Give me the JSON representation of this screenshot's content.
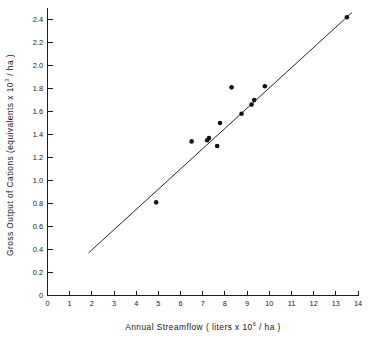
{
  "chart_data": {
    "type": "scatter",
    "title": "",
    "xlabel": "Annual Streamflow ( liters x 10⁶ / ha )",
    "xlabel_parts": {
      "prefix": "Annual  Streamflow  ( liters  x  10",
      "exponent": "6",
      "suffix": " / ha )"
    },
    "ylabel": "Gross Output of Cations (equivalents  x 10³ / ha )",
    "ylabel_parts": {
      "prefix": "Gross  Output  of  Cations  (equivalents   x 10",
      "exponent": "3",
      "suffix": " / ha )"
    },
    "xlim": [
      0,
      14
    ],
    "ylim": [
      0,
      2.5
    ],
    "xticks": [
      0,
      1,
      2,
      3,
      4,
      5,
      6,
      7,
      8,
      9,
      10,
      11,
      12,
      13,
      14
    ],
    "xticklabels": [
      "0",
      "1",
      "2",
      "3",
      "4",
      "5",
      "6",
      "7",
      "8",
      "9",
      "10",
      "11",
      "12",
      "13",
      "14"
    ],
    "yticks": [
      0,
      0.2,
      0.4,
      0.6,
      0.8,
      1.0,
      1.2,
      1.4,
      1.6,
      1.8,
      2.0,
      2.2,
      2.4
    ],
    "yticklabels": [
      "0",
      "0.2",
      "0.4",
      "0.6",
      "0.8",
      "1.0",
      "1.2",
      "1.4",
      "1.6",
      "1.8",
      "2.0",
      "2.2",
      "2.4"
    ],
    "grid": false,
    "legend": null,
    "marker": {
      "shape": "circle",
      "color": "#111111",
      "size_px": 4.6
    },
    "points": [
      {
        "x": 4.9,
        "y": 0.81
      },
      {
        "x": 6.5,
        "y": 1.34
      },
      {
        "x": 7.2,
        "y": 1.35
      },
      {
        "x": 7.28,
        "y": 1.37
      },
      {
        "x": 7.65,
        "y": 1.3
      },
      {
        "x": 7.78,
        "y": 1.5
      },
      {
        "x": 8.3,
        "y": 1.81
      },
      {
        "x": 8.75,
        "y": 1.58
      },
      {
        "x": 9.2,
        "y": 1.66
      },
      {
        "x": 9.32,
        "y": 1.7
      },
      {
        "x": 9.8,
        "y": 1.82
      },
      {
        "x": 13.5,
        "y": 2.42
      }
    ],
    "series": [
      {
        "name": "Observations",
        "type": "scatter",
        "x": [
          4.9,
          6.5,
          7.2,
          7.28,
          7.65,
          7.78,
          8.3,
          8.75,
          9.2,
          9.32,
          9.8,
          13.5
        ],
        "values": [
          0.81,
          1.34,
          1.35,
          1.37,
          1.3,
          1.5,
          1.81,
          1.58,
          1.66,
          1.7,
          1.82,
          2.42
        ]
      },
      {
        "name": "Regression line",
        "type": "line",
        "color": "#262626",
        "x": [
          1.85,
          13.72
        ],
        "values": [
          0.37,
          2.46
        ]
      }
    ],
    "fit_line": {
      "x0": 1.85,
      "y0": 0.37,
      "x1": 13.72,
      "y1": 2.46,
      "slope": 0.176,
      "intercept": 0.044
    }
  }
}
